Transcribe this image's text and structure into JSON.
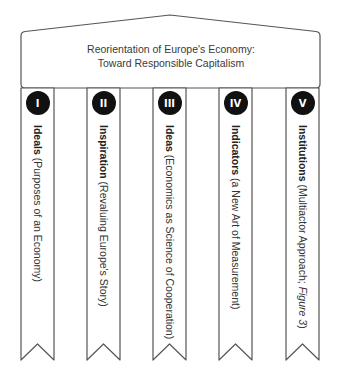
{
  "diagram": {
    "roof": {
      "title_line1": "Reorientation of Europe's Economy:",
      "title_line2": "Toward Responsible Capitalism"
    },
    "pillars": [
      {
        "numeral": "I",
        "bold": "Ideals",
        "rest": " (Purposes of an Economy)",
        "italic": ""
      },
      {
        "numeral": "II",
        "bold": "Inspiration",
        "rest": " (Revaluing Europe's Story)",
        "italic": ""
      },
      {
        "numeral": "III",
        "bold": "Ideas",
        "rest": " (Economics as Science of Cooperation)",
        "italic": ""
      },
      {
        "numeral": "IV",
        "bold": "Indicators",
        "rest": " (a New Art of Measurement)",
        "italic": ""
      },
      {
        "numeral": "V",
        "bold": "Institutions",
        "rest": " (Multiactor Approach; ",
        "italic": "Figure 3",
        "tail": ")"
      }
    ],
    "colors": {
      "outline": "#555555",
      "badge_fill": "#111111",
      "badge_text": "#ffffff",
      "text": "#333333"
    }
  }
}
